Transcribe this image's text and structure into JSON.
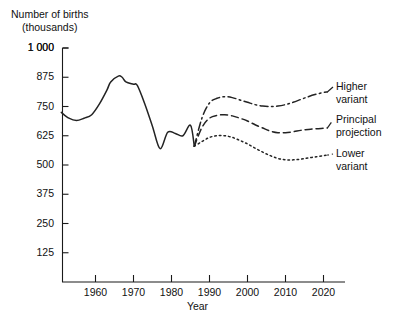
{
  "chart_data": {
    "type": "line",
    "title": "",
    "ylabel": "Number of births (thousands)",
    "ylabel_line1": "Number of births",
    "ylabel_line2": "(thousands)",
    "xlabel": "Year",
    "xlim": [
      1951,
      2023
    ],
    "ylim": [
      0,
      1000
    ],
    "grid": false,
    "legend_position": "right-inline-labels",
    "yticks": [
      125,
      250,
      375,
      500,
      625,
      750,
      875,
      1000
    ],
    "ytick_labels": [
      "125",
      "250",
      "375",
      "500",
      "625",
      "750",
      "875",
      "1 000"
    ],
    "xticks": [
      1960,
      1970,
      1980,
      1990,
      2000,
      2010,
      2020
    ],
    "xtick_labels": [
      "1960",
      "1970",
      "1980",
      "1990",
      "2000",
      "2010",
      "2020"
    ],
    "series": [
      {
        "name": "Historical births",
        "label": "",
        "style": "solid",
        "x": [
          1951,
          1953,
          1955,
          1957,
          1959,
          1961,
          1963,
          1964,
          1966,
          1967,
          1968,
          1970,
          1971,
          1973,
          1975,
          1977,
          1979,
          1981,
          1983,
          1985,
          1986
        ],
        "values": [
          725,
          700,
          690,
          700,
          715,
          760,
          820,
          855,
          880,
          875,
          855,
          845,
          840,
          760,
          665,
          570,
          640,
          635,
          625,
          670,
          580
        ]
      },
      {
        "name": "Higher variant",
        "label": "Higher\nvariant",
        "label_line1": "Higher",
        "label_line2": "variant",
        "style": "dash-dot",
        "x": [
          1986,
          1988,
          1990,
          1992,
          1994,
          1996,
          1998,
          2000,
          2002,
          2004,
          2006,
          2008,
          2010,
          2012,
          2014,
          2016,
          2018,
          2020,
          2021
        ],
        "values": [
          580,
          700,
          765,
          785,
          792,
          788,
          778,
          768,
          758,
          752,
          750,
          752,
          758,
          768,
          780,
          792,
          802,
          810,
          812
        ]
      },
      {
        "name": "Principal projection",
        "label": "Principal\nprojection",
        "label_line1": "Principal",
        "label_line2": "projection",
        "style": "dashed",
        "x": [
          1986,
          1988,
          1990,
          1992,
          1994,
          1996,
          1998,
          2000,
          2002,
          2004,
          2006,
          2008,
          2010,
          2012,
          2014,
          2016,
          2018,
          2020,
          2021
        ],
        "values": [
          580,
          660,
          700,
          712,
          715,
          710,
          700,
          688,
          672,
          658,
          645,
          638,
          638,
          642,
          648,
          652,
          655,
          657,
          658
        ]
      },
      {
        "name": "Lower variant",
        "label": "Lower\nvariant",
        "label_line1": "Lower",
        "label_line2": "variant",
        "style": "dotted",
        "x": [
          1986,
          1988,
          1990,
          1992,
          1994,
          1996,
          1998,
          2000,
          2002,
          2004,
          2006,
          2008,
          2010,
          2012,
          2014,
          2016,
          2018,
          2020,
          2021
        ],
        "values": [
          580,
          600,
          618,
          625,
          625,
          618,
          605,
          590,
          572,
          555,
          540,
          528,
          522,
          522,
          525,
          530,
          535,
          540,
          542
        ]
      }
    ]
  }
}
